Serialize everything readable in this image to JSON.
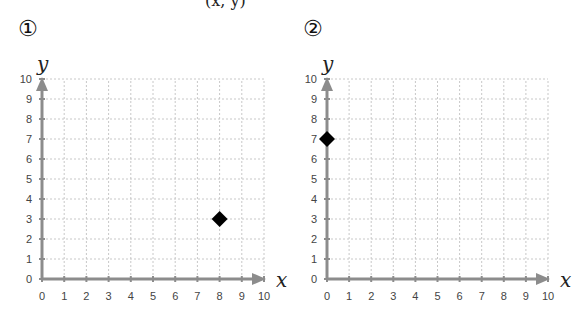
{
  "header_fragment": "(x, y)",
  "chart_data": [
    {
      "type": "scatter",
      "title": "①",
      "xlabel": "x",
      "ylabel": "y",
      "xlim": [
        0,
        10
      ],
      "ylim": [
        0,
        10
      ],
      "x_ticks": [
        0,
        1,
        2,
        3,
        4,
        5,
        6,
        7,
        8,
        9,
        10
      ],
      "y_ticks": [
        0,
        1,
        2,
        3,
        4,
        5,
        6,
        7,
        8,
        9,
        10
      ],
      "grid": true,
      "marker": "diamond",
      "points": [
        {
          "x": 8,
          "y": 3
        }
      ]
    },
    {
      "type": "scatter",
      "title": "②",
      "xlabel": "x",
      "ylabel": "y",
      "xlim": [
        0,
        10
      ],
      "ylim": [
        0,
        10
      ],
      "x_ticks": [
        0,
        1,
        2,
        3,
        4,
        5,
        6,
        7,
        8,
        9,
        10
      ],
      "y_ticks": [
        0,
        1,
        2,
        3,
        4,
        5,
        6,
        7,
        8,
        9,
        10
      ],
      "grid": true,
      "marker": "diamond",
      "points": [
        {
          "x": 0,
          "y": 7
        }
      ]
    }
  ],
  "colors": {
    "axis": "#8c8c8c",
    "grid": "#c8c8c8",
    "marker": "#000000"
  },
  "layout": [
    {
      "origin_x": 42,
      "origin_y": 279,
      "unit_x": 22.2,
      "unit_y": 20,
      "label_x": 18,
      "label_y": 36
    },
    {
      "origin_x": 327,
      "origin_y": 279,
      "unit_x": 22.1,
      "unit_y": 20,
      "label_x": 303,
      "label_y": 36
    }
  ]
}
